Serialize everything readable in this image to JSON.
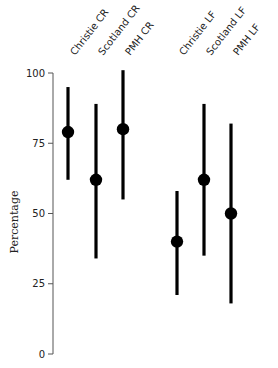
{
  "chart_data": {
    "type": "scatter",
    "subtype": "point-with-error-bars",
    "title": "",
    "xlabel": "",
    "ylabel": "Percentage",
    "ylim": [
      0,
      100
    ],
    "yticks": [
      0,
      25,
      50,
      75,
      100
    ],
    "grid": false,
    "legend": null,
    "categories": [
      "Christie CR",
      "Scotland CR",
      "PMH CR",
      "Christie LF",
      "Scotland LF",
      "PMH LF"
    ],
    "values": [
      79,
      62,
      80,
      40,
      62,
      50
    ],
    "lower": [
      62,
      34,
      55,
      21,
      35,
      18
    ],
    "upper": [
      95,
      89,
      101,
      58,
      89,
      82
    ],
    "x_positions_px": [
      68,
      96,
      123,
      177,
      204,
      231
    ]
  },
  "style": {
    "marker_color": "#000000",
    "axis_color": "#555555"
  }
}
